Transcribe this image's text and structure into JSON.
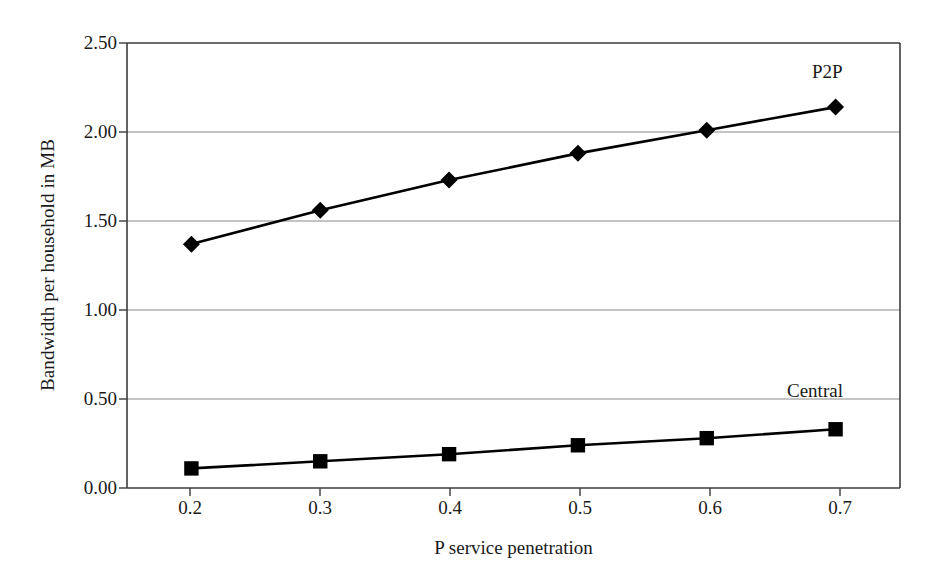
{
  "chart_data": {
    "type": "line",
    "title": "",
    "xlabel": "P service penetration",
    "ylabel": "Bandwidth per household in MB",
    "x": [
      0.2,
      0.3,
      0.4,
      0.5,
      0.6,
      0.7
    ],
    "xtick_labels": [
      "0.2",
      "0.3",
      "0.4",
      "0.5",
      "0.6",
      "0.7"
    ],
    "ytick_labels": [
      "0.00",
      "0.50",
      "1.00",
      "1.50",
      "2.00",
      "2.50"
    ],
    "yticks": [
      0.0,
      0.5,
      1.0,
      1.5,
      2.0,
      2.5
    ],
    "xlim": [
      0.15,
      0.75
    ],
    "ylim": [
      0.0,
      2.5
    ],
    "grid": "horizontal",
    "legend_position": "inline-annotation",
    "series": [
      {
        "name": "P2P",
        "marker": "diamond",
        "color": "#000000",
        "values": [
          1.37,
          1.56,
          1.73,
          1.88,
          2.01,
          2.14
        ],
        "annotation": {
          "label": "P2P",
          "x": 0.68,
          "y": 2.32
        }
      },
      {
        "name": "Central",
        "marker": "square",
        "color": "#000000",
        "values": [
          0.11,
          0.15,
          0.19,
          0.24,
          0.28,
          0.33
        ],
        "annotation": {
          "label": "Central",
          "x": 0.665,
          "y": 0.585
        }
      }
    ]
  },
  "axes": {
    "y_title": "Bandwidth per household in MB",
    "x_title": "P service penetration",
    "y_labels": [
      "2.50",
      "2.00",
      "1.50",
      "1.00",
      "0.50",
      "0.00"
    ],
    "x_labels": [
      "0.2",
      "0.3",
      "0.4",
      "0.5",
      "0.6",
      "0.7"
    ]
  },
  "annotations": {
    "p2p_label": "P2P",
    "central_label": "Central"
  },
  "colors": {
    "axis": "#3c3c3c",
    "grid": "#8a8a8a",
    "series": "#000000",
    "background": "#ffffff"
  }
}
